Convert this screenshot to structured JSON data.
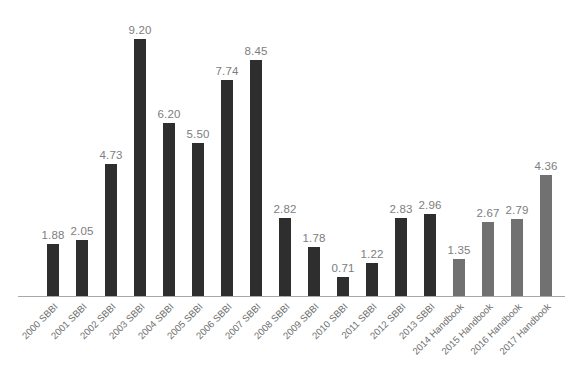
{
  "chart_data": {
    "type": "bar",
    "title": "",
    "subtitle": "",
    "xlabel": "",
    "ylabel": "",
    "grid": false,
    "legend": "none",
    "ylim": [
      0,
      9.6
    ],
    "value_label_format": "0.00",
    "categories": [
      "2000 SBBI",
      "2001 SBBI",
      "2002 SBBI",
      "2003 SBBI",
      "2004 SBBI",
      "2005 SBBI",
      "2006 SBBI",
      "2007 SBBI",
      "2008 SBBI",
      "2009 SBBI",
      "2010 SBBI",
      "2011 SBBI",
      "2012 SBBI",
      "2013 SBBI",
      "2014 Handbook",
      "2015 Handbook",
      "2016 Handbook",
      "2017 Handbook"
    ],
    "values": [
      1.88,
      2.05,
      4.73,
      9.2,
      6.2,
      5.5,
      7.74,
      8.45,
      2.82,
      1.78,
      0.71,
      1.22,
      2.83,
      2.96,
      1.35,
      2.67,
      2.79,
      4.36
    ],
    "value_labels": [
      "1.88",
      "2.05",
      "4.73",
      "9.20",
      "6.20",
      "5.50",
      "7.74",
      "8.45",
      "2.82",
      "1.78",
      "0.71",
      "1.22",
      "2.83",
      "2.96",
      "1.35",
      "2.67",
      "2.79",
      "4.36"
    ],
    "series_of_bar": [
      "sbbi",
      "sbbi",
      "sbbi",
      "sbbi",
      "sbbi",
      "sbbi",
      "sbbi",
      "sbbi",
      "sbbi",
      "sbbi",
      "sbbi",
      "sbbi",
      "sbbi",
      "sbbi",
      "handbook",
      "handbook",
      "handbook",
      "handbook"
    ],
    "series": [
      {
        "name": "SBBI",
        "color": "#2e2e2e"
      },
      {
        "name": "Handbook",
        "color": "#717171"
      }
    ]
  },
  "style": {
    "background": "#ffffff",
    "bar_color_sbbi": "#2e2e2e",
    "bar_color_handbook": "#717171",
    "value_label_color": "#7d7d7d",
    "category_label_color": "#6f6f6f",
    "axis_line_color": "#a8a8a8"
  }
}
